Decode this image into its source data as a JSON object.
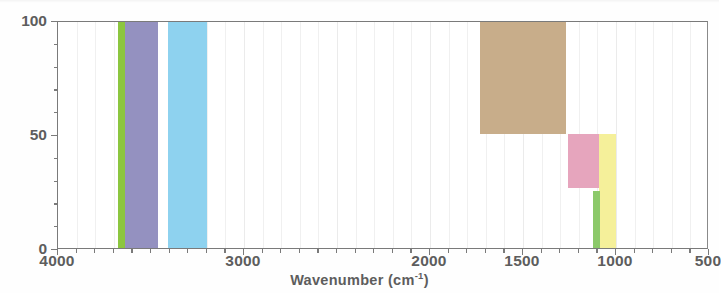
{
  "chart_data": {
    "type": "bar",
    "title": "",
    "subtitle": "",
    "xlabel": "Wavenumber (cm-1)",
    "xlabel_base": "Wavenumber (cm",
    "xlabel_sup": "-1",
    "xlabel_close": ")",
    "ylabel": "",
    "xlim": [
      4000,
      500
    ],
    "ylim": [
      0,
      100
    ],
    "x_reversed": true,
    "grid": true,
    "grid_axis": "x",
    "legend": "none",
    "x_ticks": [
      {
        "value": 4000,
        "label": "4000"
      },
      {
        "value": 3000,
        "label": "3000"
      },
      {
        "value": 2000,
        "label": "2000"
      },
      {
        "value": 1500,
        "label": "1500"
      },
      {
        "value": 1000,
        "label": "1000"
      },
      {
        "value": 500,
        "label": "500"
      }
    ],
    "x_minor_tick_step": 100,
    "y_ticks": [
      {
        "value": 0,
        "label": "0"
      },
      {
        "value": 50,
        "label": "50"
      },
      {
        "value": 100,
        "label": "100"
      }
    ],
    "y_minor_tick_step": 10,
    "bands": [
      {
        "name": "green-band-3680",
        "x_start": 3680,
        "x_end": 3640,
        "y_start": 0,
        "y_end": 100,
        "color": "#8cc63f"
      },
      {
        "name": "purple-band-3640",
        "x_start": 3640,
        "x_end": 3460,
        "y_start": 0,
        "y_end": 100,
        "color": "#9491c0"
      },
      {
        "name": "blue-band-3410",
        "x_start": 3410,
        "x_end": 3200,
        "y_start": 0,
        "y_end": 100,
        "color": "#8ed2ef"
      },
      {
        "name": "tan-band-1270",
        "x_start": 1270,
        "x_end": 1730,
        "y_start": 51,
        "y_end": 100,
        "color": "#c8ad8a"
      },
      {
        "name": "tan-band-upper",
        "x_start": 1270,
        "x_end": 1730,
        "y_start": 51,
        "y_end": 100,
        "color": "#c8ad8a"
      },
      {
        "name": "pink-band-1260",
        "x_start": 1260,
        "x_end": 1090,
        "y_start": 27,
        "y_end": 51,
        "color": "#e6a5bd"
      },
      {
        "name": "yellow-band-1090",
        "x_start": 1090,
        "x_end": 1000,
        "y_start": 0,
        "y_end": 51,
        "color": "#f5f09a"
      },
      {
        "name": "green-band-1120",
        "x_start": 1125,
        "x_end": 1085,
        "y_start": 0,
        "y_end": 26,
        "color": "#8cc96a"
      }
    ],
    "series": [
      {
        "name": "O-H / N-H stretch",
        "category": "3680-3200",
        "value": 100,
        "color": "#9491c0"
      },
      {
        "name": "C-H stretch",
        "category": "3410-3200",
        "value": 100,
        "color": "#8ed2ef"
      },
      {
        "name": "C-O / fingerprint",
        "category": "1730-1270",
        "value": 100,
        "color": "#c8ad8a"
      },
      {
        "name": "C-N stretch",
        "category": "1260-1090",
        "value": 51,
        "color": "#e6a5bd"
      },
      {
        "name": "C-O stretch",
        "category": "1090-1000",
        "value": 51,
        "color": "#f5f09a"
      },
      {
        "name": "=C-H bend",
        "category": "1125-1085",
        "value": 26,
        "color": "#8cc96a"
      }
    ],
    "colors": {
      "green": "#8cc63f",
      "purple": "#9491c0",
      "lightblue": "#8ed2ef",
      "tan": "#c8ad8a",
      "pink": "#e6a5bd",
      "yellow": "#f5f09a",
      "green2": "#8cc96a",
      "axis": "#7a7a7a",
      "text": "#5d5d5d",
      "grid": "#f0f0f0",
      "background": "#ffffff"
    }
  }
}
